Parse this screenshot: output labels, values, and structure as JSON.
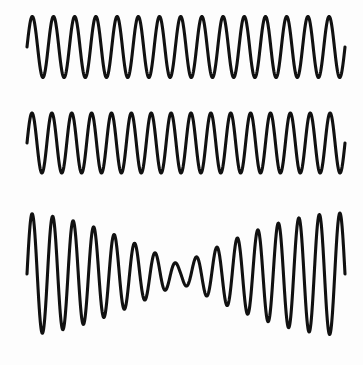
{
  "figure": {
    "width": 363,
    "height": 365,
    "background_color": "#fdfdfd",
    "stroke_color": "#111111",
    "stroke_width": 3.1
  },
  "chart_data": {
    "type": "line",
    "subtitle": "",
    "xlabel": "",
    "ylabel": "",
    "grid": false,
    "legend_position": "none",
    "axis_visible": false,
    "tick_labels_x": [],
    "tick_labels_y": [],
    "x_start_px": 27,
    "x_end_px": 345,
    "xlim": [
      0,
      1
    ],
    "series": [
      {
        "name": "wave-1",
        "role": "first source tone",
        "waveform": "sine",
        "cycles": 15,
        "amplitude_px": 30.5,
        "baseline_y_px": 47,
        "peak_y_px": 17,
        "trough_y_px": 78,
        "phase_deg": 0,
        "modulated": false
      },
      {
        "name": "wave-2",
        "role": "second source tone (slightly higher frequency)",
        "waveform": "sine",
        "cycles": 16,
        "amplitude_px": 30,
        "baseline_y_px": 143,
        "peak_y_px": 113,
        "trough_y_px": 173,
        "phase_deg": 0,
        "modulated": false
      },
      {
        "name": "wave-3",
        "role": "sum of wave-1 and wave-2 showing beat envelope",
        "waveform": "sum-of-sines",
        "cycles": 15.5,
        "amplitude_px": 61,
        "baseline_y_px": 274,
        "peak_y_px": 213,
        "trough_y_px": 335,
        "phase_deg": 0,
        "modulated": true,
        "envelope_nodes": 1,
        "node_position_px": 180,
        "node_residual_amplitude_px": 9,
        "beat_frequency_cycles": 1
      }
    ]
  },
  "panels": [
    {
      "id": "panel-1",
      "label": "",
      "series_ref": "wave-1"
    },
    {
      "id": "panel-2",
      "label": "",
      "series_ref": "wave-2"
    },
    {
      "id": "panel-3",
      "label": "",
      "series_ref": "wave-3"
    }
  ]
}
